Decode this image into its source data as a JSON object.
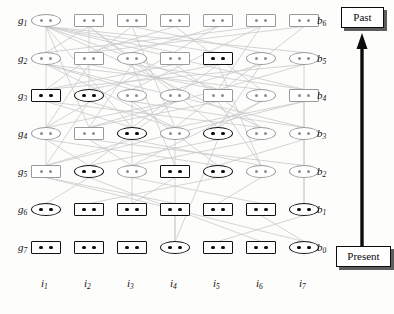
{
  "figure": {
    "colors": {
      "dark_stroke": "#111111",
      "light_stroke": "#9a9a9a",
      "edge": "#c9c9c9",
      "background": "#fdfdfc"
    }
  },
  "axes": {
    "row_labels_left": [
      {
        "base": "g",
        "sub": "1"
      },
      {
        "base": "g",
        "sub": "2"
      },
      {
        "base": "g",
        "sub": "3"
      },
      {
        "base": "g",
        "sub": "4"
      },
      {
        "base": "g",
        "sub": "5"
      },
      {
        "base": "g",
        "sub": "6"
      },
      {
        "base": "g",
        "sub": "7"
      }
    ],
    "row_labels_right": [
      {
        "base": "b",
        "sub": "6"
      },
      {
        "base": "b",
        "sub": "5"
      },
      {
        "base": "b",
        "sub": "4"
      },
      {
        "base": "b",
        "sub": "3"
      },
      {
        "base": "b",
        "sub": "2"
      },
      {
        "base": "b",
        "sub": "1"
      },
      {
        "base": "b",
        "sub": "0"
      }
    ],
    "column_labels_bottom": [
      {
        "base": "i",
        "sub": "1"
      },
      {
        "base": "i",
        "sub": "2"
      },
      {
        "base": "i",
        "sub": "3"
      },
      {
        "base": "i",
        "sub": "4"
      },
      {
        "base": "i",
        "sub": "5"
      },
      {
        "base": "i",
        "sub": "6"
      },
      {
        "base": "i",
        "sub": "7"
      }
    ]
  },
  "timeline": {
    "past_label": "Past",
    "present_label": "Present",
    "arrow_direction": "up"
  },
  "grid": {
    "columns_x": [
      46,
      89,
      132,
      175,
      218,
      261,
      304
    ],
    "rows_y": [
      14,
      52,
      89,
      127,
      165,
      203,
      241
    ],
    "cells": [
      [
        {
          "shape": "ellipse",
          "tone": "light"
        },
        {
          "shape": "rect",
          "tone": "light"
        },
        {
          "shape": "rect",
          "tone": "light"
        },
        {
          "shape": "rect",
          "tone": "light"
        },
        {
          "shape": "rect",
          "tone": "light"
        },
        {
          "shape": "rect",
          "tone": "light"
        },
        {
          "shape": "rect",
          "tone": "light"
        }
      ],
      [
        {
          "shape": "ellipse",
          "tone": "light"
        },
        {
          "shape": "rect",
          "tone": "light"
        },
        {
          "shape": "ellipse",
          "tone": "light"
        },
        {
          "shape": "rect",
          "tone": "light"
        },
        {
          "shape": "rect",
          "tone": "dark"
        },
        {
          "shape": "ellipse",
          "tone": "light"
        },
        {
          "shape": "ellipse",
          "tone": "light"
        }
      ],
      [
        {
          "shape": "rect",
          "tone": "dark"
        },
        {
          "shape": "ellipse",
          "tone": "dark"
        },
        {
          "shape": "ellipse",
          "tone": "light"
        },
        {
          "shape": "ellipse",
          "tone": "light"
        },
        {
          "shape": "rect",
          "tone": "light"
        },
        {
          "shape": "ellipse",
          "tone": "light"
        },
        {
          "shape": "rect",
          "tone": "light"
        }
      ],
      [
        {
          "shape": "ellipse",
          "tone": "light"
        },
        {
          "shape": "rect",
          "tone": "light"
        },
        {
          "shape": "ellipse",
          "tone": "dark"
        },
        {
          "shape": "ellipse",
          "tone": "light"
        },
        {
          "shape": "ellipse",
          "tone": "dark"
        },
        {
          "shape": "ellipse",
          "tone": "light"
        },
        {
          "shape": "ellipse",
          "tone": "light"
        }
      ],
      [
        {
          "shape": "rect",
          "tone": "light"
        },
        {
          "shape": "ellipse",
          "tone": "dark"
        },
        {
          "shape": "ellipse",
          "tone": "light"
        },
        {
          "shape": "rect",
          "tone": "dark"
        },
        {
          "shape": "ellipse",
          "tone": "dark"
        },
        {
          "shape": "ellipse",
          "tone": "light"
        },
        {
          "shape": "ellipse",
          "tone": "light"
        }
      ],
      [
        {
          "shape": "ellipse",
          "tone": "dark"
        },
        {
          "shape": "rect",
          "tone": "dark"
        },
        {
          "shape": "rect",
          "tone": "dark"
        },
        {
          "shape": "rect",
          "tone": "dark"
        },
        {
          "shape": "rect",
          "tone": "dark"
        },
        {
          "shape": "rect",
          "tone": "dark"
        },
        {
          "shape": "ellipse",
          "tone": "dark"
        }
      ],
      [
        {
          "shape": "rect",
          "tone": "dark"
        },
        {
          "shape": "rect",
          "tone": "dark"
        },
        {
          "shape": "rect",
          "tone": "dark"
        },
        {
          "shape": "ellipse",
          "tone": "dark"
        },
        {
          "shape": "rect",
          "tone": "dark"
        },
        {
          "shape": "rect",
          "tone": "dark"
        },
        {
          "shape": "ellipse",
          "tone": "dark"
        }
      ]
    ]
  },
  "edges": [
    [
      0,
      0,
      1,
      3
    ],
    [
      0,
      0,
      1,
      4
    ],
    [
      0,
      0,
      2,
      4
    ],
    [
      0,
      0,
      2,
      6
    ],
    [
      0,
      0,
      3,
      2
    ],
    [
      0,
      0,
      3,
      5
    ],
    [
      0,
      0,
      1,
      6
    ],
    [
      0,
      1,
      1,
      0
    ],
    [
      0,
      1,
      2,
      3
    ],
    [
      0,
      1,
      3,
      4
    ],
    [
      0,
      2,
      1,
      5
    ],
    [
      0,
      2,
      2,
      0
    ],
    [
      0,
      3,
      1,
      1
    ],
    [
      0,
      3,
      2,
      5
    ],
    [
      0,
      4,
      1,
      2
    ],
    [
      0,
      4,
      3,
      0
    ],
    [
      0,
      5,
      1,
      0
    ],
    [
      0,
      5,
      2,
      2
    ],
    [
      0,
      6,
      1,
      1
    ],
    [
      0,
      6,
      3,
      3
    ],
    [
      1,
      0,
      2,
      2
    ],
    [
      1,
      0,
      2,
      5
    ],
    [
      1,
      0,
      3,
      3
    ],
    [
      1,
      0,
      3,
      6
    ],
    [
      1,
      1,
      2,
      4
    ],
    [
      1,
      1,
      3,
      0
    ],
    [
      1,
      2,
      2,
      6
    ],
    [
      1,
      2,
      3,
      1
    ],
    [
      1,
      3,
      2,
      0
    ],
    [
      1,
      3,
      3,
      5
    ],
    [
      1,
      4,
      2,
      1
    ],
    [
      1,
      4,
      3,
      2
    ],
    [
      1,
      5,
      2,
      3
    ],
    [
      1,
      5,
      3,
      4
    ],
    [
      1,
      6,
      2,
      0
    ],
    [
      1,
      6,
      3,
      1
    ],
    [
      2,
      0,
      3,
      2
    ],
    [
      2,
      0,
      3,
      5
    ],
    [
      2,
      1,
      3,
      3
    ],
    [
      2,
      1,
      4,
      0
    ],
    [
      2,
      2,
      3,
      6
    ],
    [
      2,
      2,
      4,
      4
    ],
    [
      2,
      3,
      3,
      0
    ],
    [
      2,
      3,
      4,
      1
    ],
    [
      2,
      4,
      3,
      1
    ],
    [
      2,
      4,
      4,
      5
    ],
    [
      2,
      5,
      3,
      4
    ],
    [
      2,
      5,
      4,
      2
    ],
    [
      2,
      6,
      3,
      3
    ],
    [
      2,
      6,
      4,
      0
    ],
    [
      3,
      0,
      4,
      1
    ],
    [
      3,
      0,
      4,
      4
    ],
    [
      3,
      1,
      4,
      2
    ],
    [
      3,
      1,
      4,
      6
    ],
    [
      3,
      2,
      4,
      0
    ],
    [
      3,
      2,
      4,
      5
    ],
    [
      3,
      3,
      4,
      3
    ],
    [
      3,
      4,
      4,
      1
    ],
    [
      3,
      5,
      4,
      2
    ],
    [
      3,
      6,
      4,
      4
    ],
    [
      4,
      0,
      5,
      3
    ],
    [
      4,
      1,
      5,
      0
    ],
    [
      4,
      2,
      5,
      5
    ],
    [
      4,
      3,
      5,
      2
    ],
    [
      4,
      3,
      6,
      3
    ],
    [
      4,
      4,
      5,
      1
    ],
    [
      4,
      5,
      5,
      4
    ],
    [
      4,
      6,
      5,
      6
    ],
    [
      5,
      3,
      6,
      3
    ],
    [
      5,
      5,
      6,
      6
    ],
    [
      5,
      6,
      6,
      4
    ],
    [
      4,
      0,
      6,
      6
    ],
    [
      4,
      1,
      6,
      5
    ],
    [
      3,
      6,
      5,
      6
    ],
    [
      2,
      6,
      4,
      6
    ],
    [
      1,
      6,
      3,
      6
    ],
    [
      0,
      0,
      4,
      0
    ],
    [
      0,
      0,
      3,
      1
    ],
    [
      0,
      1,
      2,
      1
    ],
    [
      0,
      2,
      3,
      3
    ],
    [
      0,
      5,
      2,
      4
    ],
    [
      1,
      2,
      4,
      3
    ],
    [
      1,
      4,
      4,
      5
    ],
    [
      2,
      2,
      5,
      2
    ],
    [
      3,
      4,
      6,
      3
    ]
  ]
}
